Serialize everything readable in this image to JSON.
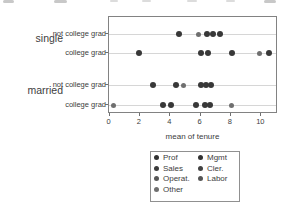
{
  "chart_data": {
    "type": "scatter",
    "title": "",
    "xlabel": "mean of tenure",
    "ylabel": "",
    "xlim": [
      0,
      11
    ],
    "xticks": [
      0,
      2,
      4,
      6,
      8,
      10
    ],
    "grid": "horizontal guide line per category row",
    "legend_position": "bottom",
    "point_colors": {
      "dark": "#383838",
      "medium": "#6f6f6f"
    },
    "groups": [
      {
        "label": "single",
        "rows": [
          {
            "label": "not college grad",
            "points": [
              {
                "x": 4.6,
                "shade": "dark"
              },
              {
                "x": 5.9,
                "shade": "medium"
              },
              {
                "x": 6.45,
                "shade": "dark"
              },
              {
                "x": 6.87,
                "shade": "dark"
              },
              {
                "x": 7.3,
                "shade": "dark"
              }
            ]
          },
          {
            "label": "college grad",
            "points": [
              {
                "x": 1.95,
                "shade": "dark"
              },
              {
                "x": 6.05,
                "shade": "dark"
              },
              {
                "x": 6.5,
                "shade": "dark"
              },
              {
                "x": 8.1,
                "shade": "dark"
              },
              {
                "x": 9.9,
                "shade": "medium"
              },
              {
                "x": 10.55,
                "shade": "dark"
              }
            ]
          }
        ]
      },
      {
        "label": "married",
        "rows": [
          {
            "label": "not college grad",
            "points": [
              {
                "x": 2.9,
                "shade": "dark"
              },
              {
                "x": 4.4,
                "shade": "dark"
              },
              {
                "x": 4.9,
                "shade": "medium"
              },
              {
                "x": 6.05,
                "shade": "dark"
              },
              {
                "x": 6.4,
                "shade": "dark"
              },
              {
                "x": 6.75,
                "shade": "dark"
              }
            ]
          },
          {
            "label": "college grad",
            "points": [
              {
                "x": 0.3,
                "shade": "medium"
              },
              {
                "x": 3.55,
                "shade": "dark"
              },
              {
                "x": 4.1,
                "shade": "dark"
              },
              {
                "x": 5.75,
                "shade": "dark"
              },
              {
                "x": 6.35,
                "shade": "dark"
              },
              {
                "x": 6.62,
                "shade": "dark"
              },
              {
                "x": 8.1,
                "shade": "medium"
              }
            ]
          }
        ]
      }
    ],
    "legend": {
      "items": [
        {
          "label": "Prof",
          "color": "#323232",
          "column": 1
        },
        {
          "label": "Sales",
          "color": "#3a3a3a",
          "column": 1
        },
        {
          "label": "Operat.",
          "color": "#575757",
          "column": 1
        },
        {
          "label": "Other",
          "color": "#6f6f6f",
          "column": 1
        },
        {
          "label": "Mgmt",
          "color": "#323232",
          "column": 2
        },
        {
          "label": "Cler.",
          "color": "#424242",
          "column": 2
        },
        {
          "label": "Labor",
          "color": "#555555",
          "column": 2
        }
      ]
    }
  }
}
